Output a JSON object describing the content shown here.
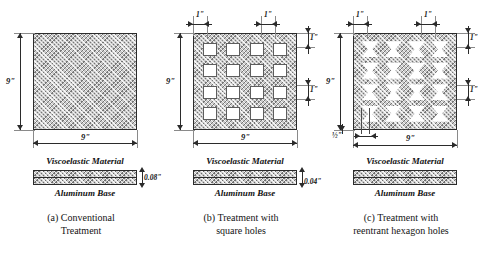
{
  "figure": {
    "units": "inches",
    "plate_fill_color": "#c9c9c9",
    "line_color": "#2b2b2b",
    "hole_fill_color": "#ffffff"
  },
  "panels": [
    {
      "id": "a",
      "caption_line1": "(a)  Conventional",
      "caption_line2": "Treatment",
      "plate": {
        "width_label": "9\"",
        "height_label": "9\"",
        "hole_type": "none",
        "hole_rows": 0,
        "hole_cols": 0
      },
      "cross_section": {
        "top_label": "Viscoelastic Material",
        "bottom_label": "Aluminum Base",
        "thickness_label": "0.08\"",
        "layers": [
          "viscoelastic",
          "aluminum"
        ]
      },
      "dimensions": []
    },
    {
      "id": "b",
      "caption_line1": "(b) Treatment with",
      "caption_line2": "square holes",
      "plate": {
        "width_label": "9\"",
        "height_label": "9\"",
        "hole_type": "square",
        "hole_rows": 4,
        "hole_cols": 4
      },
      "cross_section": {
        "top_label": "Viscoelastic Material",
        "bottom_label": "Aluminum Base",
        "thickness_label": "0.04\"",
        "layers": [
          "viscoelastic",
          "aluminum"
        ]
      },
      "dimensions": [
        {
          "label": "1\"",
          "position": "top-left",
          "meaning": "edge margin to first hole"
        },
        {
          "label": "1\"",
          "position": "top-right",
          "meaning": "hole width"
        },
        {
          "label": "1\"",
          "position": "right-upper",
          "meaning": "edge margin to first row"
        },
        {
          "label": "1\"",
          "position": "right-lower",
          "meaning": "hole height"
        }
      ]
    },
    {
      "id": "c",
      "caption_line1": "(c) Treatment with",
      "caption_line2": "reentrant hexagon holes",
      "plate": {
        "width_label": "9\"",
        "height_label": "9\"",
        "hole_type": "reentrant-hexagon",
        "hole_rows": 4,
        "hole_cols": 4
      },
      "cross_section": {
        "top_label": "Viscoelastic Material",
        "bottom_label": "Aluminum Base",
        "thickness_label": "",
        "layers": [
          "viscoelastic",
          "aluminum"
        ]
      },
      "dimensions": [
        {
          "label": "1\"",
          "position": "top-left",
          "meaning": "edge margin to first hole"
        },
        {
          "label": "1\"",
          "position": "top-right",
          "meaning": "hole width"
        },
        {
          "label": "1\"",
          "position": "right-upper",
          "meaning": "edge margin to first row"
        },
        {
          "label": "1\"",
          "position": "right-lower",
          "meaning": "hole height"
        },
        {
          "label": "½\"",
          "position": "bottom-left",
          "meaning": "reentrant neck width"
        }
      ]
    }
  ]
}
